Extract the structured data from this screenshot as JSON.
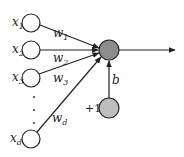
{
  "diagram": {
    "type": "perceptron",
    "inputs": [
      {
        "name": "x",
        "sub": "1",
        "weight": "w",
        "weight_sub": "1"
      },
      {
        "name": "x",
        "sub": "2",
        "weight": "w",
        "weight_sub": "2"
      },
      {
        "name": "x",
        "sub": "3",
        "weight": "w",
        "weight_sub": "3"
      },
      {
        "name": "x",
        "sub": "d",
        "weight": "w",
        "weight_sub": "d"
      }
    ],
    "ellipsis": "⋮",
    "bias": {
      "label": "b",
      "input_label": "+1"
    },
    "colors": {
      "sum_node": "#8c8c8c",
      "bias_node": "#bdbdbd",
      "input_node": "#ffffff",
      "stroke": "#222222"
    }
  }
}
